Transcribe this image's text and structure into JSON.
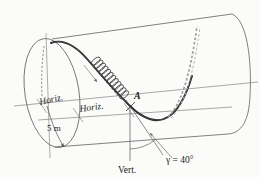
{
  "figure": {
    "background_color": "#fbfbfa",
    "line_color": "#3a3a3a",
    "helix_color": "#1a1a1a",
    "dashed_color": "#8a8a8a",
    "labels": {
      "horiz_left": "Horiz.",
      "horiz_right": "Horiz.",
      "radius": "5 m",
      "point_a": "A",
      "vertical": "Vert.",
      "angle": "γ = 40°"
    },
    "annotations": {
      "radius_value": "5",
      "radius_unit": "m",
      "angle_symbol": "γ",
      "angle_value": "40",
      "angle_unit": "°"
    },
    "elements": {
      "cylinder": "cylinder-body",
      "end_cap": "left-end-ellipse",
      "helix": "helix-curve",
      "helix_dashed": "helix-hidden-continuation",
      "coil": "coil-spring-element",
      "axis": "cylinder-axis",
      "vert_line": "vertical-reference-line",
      "angle_arc": "angle-arc-gamma",
      "radius_arrow": "radius-arrow-5m",
      "tangent": "tangent-line-at-a"
    }
  }
}
